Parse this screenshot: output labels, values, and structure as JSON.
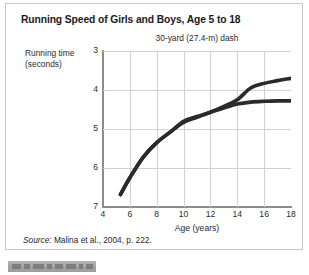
{
  "figure": {
    "title": "Running Speed of Girls and Boys, Age 5 to 18",
    "subtitle": "30-yard (27.4-m) dash",
    "source_label": "Source:",
    "source_text": " Malina et al., 2004, p. 222.",
    "caption_redacted": ""
  },
  "colors": {
    "boys_line": "#2a2a2a",
    "girls_line": "#2a2a2a",
    "grid": "#d0d0d0",
    "axis": "#8c8c8c",
    "text": "#2b2b2b",
    "border": "#c8c8c8"
  },
  "chart_data": {
    "type": "line",
    "title": "Running Speed of Girls and Boys, Age 5 to 18",
    "subtitle": "30-yard (27.4-m) dash",
    "xlabel": "Age (years)",
    "ylabel": "Running time (seconds)",
    "xlim": [
      4,
      18
    ],
    "ylim": [
      3,
      7
    ],
    "y_inverted": true,
    "grid": true,
    "legend_position": "inside-bottom-right",
    "xticks": [
      4,
      6,
      8,
      10,
      12,
      14,
      16,
      18
    ],
    "yticks": [
      3,
      4,
      5,
      6,
      7
    ],
    "series": [
      {
        "name": "Boys",
        "x": [
          5.3,
          6,
          7,
          8,
          9,
          10,
          11,
          12,
          13,
          14,
          15,
          16,
          17,
          18
        ],
        "values": [
          6.68,
          6.25,
          5.72,
          5.35,
          5.08,
          4.83,
          4.7,
          4.57,
          4.42,
          4.25,
          3.95,
          3.83,
          3.76,
          3.7
        ]
      },
      {
        "name": "Girls",
        "x": [
          5.3,
          6,
          7,
          8,
          9,
          10,
          11,
          12,
          13,
          14,
          15,
          16,
          17,
          18
        ],
        "values": [
          6.68,
          6.25,
          5.72,
          5.35,
          5.08,
          4.8,
          4.68,
          4.57,
          4.46,
          4.36,
          4.31,
          4.29,
          4.28,
          4.28
        ]
      }
    ]
  },
  "legend": {
    "items": [
      {
        "label": "Boys"
      },
      {
        "label": "Girls"
      }
    ]
  }
}
